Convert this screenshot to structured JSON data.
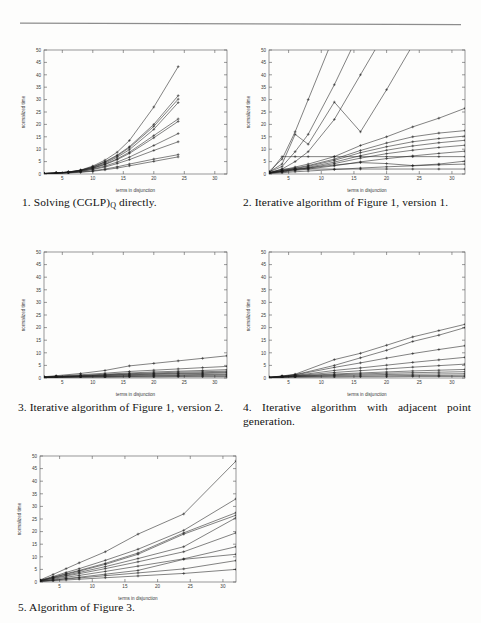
{
  "page": {
    "background": "#fdfdfc",
    "rule_color": "#8d8d8d"
  },
  "figures": [
    {
      "id": "fig1",
      "caption_number": "1.",
      "caption_text_before": "Solving (CGLP)",
      "caption_subscript": "Q",
      "caption_text_after": " directly.",
      "caption_plain": "1. Solving (CGLP)Q directly."
    },
    {
      "id": "fig2",
      "caption_number": "2.",
      "caption_plain": "2. Iterative algorithm of Figure 1, version 1."
    },
    {
      "id": "fig3",
      "caption_number": "3.",
      "caption_plain": "3. Iterative algorithm of Figure 1, version 2."
    },
    {
      "id": "fig4",
      "caption_number": "4.",
      "caption_plain": "4. Iterative algorithm with adjacent point generation."
    },
    {
      "id": "fig5",
      "caption_number": "5.",
      "caption_plain": "5. Algorithm of Figure 3."
    }
  ],
  "chart_data": [
    {
      "type": "line",
      "title": "1. Solving (CGLP)_Q directly.",
      "xlabel": "terms in disjunction",
      "ylabel": "normalized time",
      "xlim": [
        2,
        32
      ],
      "ylim": [
        0,
        50
      ],
      "xticks": [
        5,
        10,
        15,
        20,
        25,
        30
      ],
      "yticks": [
        0,
        5,
        10,
        15,
        20,
        25,
        30,
        35,
        40,
        45,
        50
      ],
      "grid": false,
      "legend": "none",
      "x": [
        2,
        4,
        6,
        8,
        10,
        12,
        14,
        16,
        20,
        24
      ],
      "series": [
        {
          "name": "s1",
          "values": [
            0.2,
            0.4,
            0.8,
            1.6,
            3.2,
            5.6,
            8.8,
            13.5,
            27.0,
            43.3
          ]
        },
        {
          "name": "s2",
          "values": [
            0.2,
            0.4,
            0.8,
            1.5,
            2.9,
            5.0,
            7.6,
            11.0,
            20.0,
            31.6
          ]
        },
        {
          "name": "s3",
          "values": [
            0.2,
            0.4,
            0.8,
            1.5,
            2.8,
            4.8,
            7.3,
            10.6,
            19.2,
            30.2
          ]
        },
        {
          "name": "s4",
          "values": [
            0.2,
            0.4,
            0.7,
            1.4,
            2.6,
            4.4,
            6.8,
            9.8,
            18.0,
            28.8
          ]
        },
        {
          "name": "s5",
          "values": [
            0.2,
            0.4,
            0.7,
            1.3,
            2.4,
            4.0,
            6.1,
            8.8,
            15.5,
            22.2
          ]
        },
        {
          "name": "s6",
          "values": [
            0.2,
            0.4,
            0.7,
            1.3,
            2.3,
            3.8,
            5.8,
            8.3,
            14.6,
            21.2
          ]
        },
        {
          "name": "s7",
          "values": [
            0.2,
            0.3,
            0.6,
            1.1,
            2.0,
            3.2,
            4.8,
            6.8,
            11.5,
            16.3
          ]
        },
        {
          "name": "s8",
          "values": [
            0.2,
            0.3,
            0.6,
            1.0,
            1.8,
            2.8,
            4.2,
            5.8,
            9.5,
            13.0
          ]
        },
        {
          "name": "s9",
          "values": [
            0.1,
            0.3,
            0.5,
            0.8,
            1.3,
            2.0,
            2.9,
            4.0,
            6.0,
            7.8
          ]
        },
        {
          "name": "s10",
          "values": [
            0.1,
            0.2,
            0.4,
            0.7,
            1.1,
            1.7,
            2.4,
            3.3,
            5.1,
            6.9
          ]
        }
      ]
    },
    {
      "type": "line",
      "title": "2. Iterative algorithm of Figure 1, version 1.",
      "xlabel": "terms in disjunction",
      "ylabel": "normalized time",
      "xlim": [
        2,
        32
      ],
      "ylim": [
        0,
        50
      ],
      "xticks": [
        5,
        10,
        15,
        20,
        25,
        30
      ],
      "yticks": [
        0,
        5,
        10,
        15,
        20,
        25,
        30,
        35,
        40,
        45,
        50
      ],
      "grid": false,
      "legend": "none",
      "x": [
        2,
        4,
        6,
        8,
        12,
        16,
        20,
        24,
        28,
        32
      ],
      "series": [
        {
          "name": "steep1",
          "values": [
            1.0,
            6.0,
            17.0,
            30.0,
            56.0,
            78.0,
            99.0,
            120.0,
            140.0,
            160.0
          ]
        },
        {
          "name": "steep2",
          "values": [
            0.8,
            3.0,
            9.0,
            16.0,
            36.0,
            58.0,
            80.0,
            100.0,
            120.0,
            140.0
          ]
        },
        {
          "name": "steep3",
          "values": [
            0.6,
            2.0,
            5.0,
            9.0,
            22.0,
            40.0,
            58.0,
            76.0,
            94.0,
            112.0
          ]
        },
        {
          "name": "zig",
          "values": [
            0.8,
            4.0,
            16.0,
            12.0,
            29.0,
            17.0,
            34.0,
            52.0,
            70.0,
            88.0
          ]
        },
        {
          "name": "lin1",
          "values": [
            0.6,
            1.6,
            2.8,
            4.0,
            7.0,
            11.5,
            15.0,
            19.0,
            22.5,
            26.5
          ]
        },
        {
          "name": "lin2",
          "values": [
            0.5,
            1.4,
            2.4,
            3.4,
            6.0,
            9.5,
            12.5,
            15.0,
            16.5,
            17.5
          ]
        },
        {
          "name": "lin3",
          "values": [
            0.5,
            1.3,
            2.2,
            3.1,
            5.5,
            8.6,
            11.0,
            13.0,
            14.3,
            15.3
          ]
        },
        {
          "name": "lin4",
          "values": [
            0.4,
            1.1,
            1.9,
            2.7,
            4.8,
            7.4,
            9.6,
            11.3,
            12.6,
            13.6
          ]
        },
        {
          "name": "lin5",
          "values": [
            0.4,
            1.0,
            1.7,
            2.4,
            4.2,
            6.4,
            8.2,
            9.6,
            10.7,
            11.6
          ]
        },
        {
          "name": "lin6",
          "values": [
            0.3,
            0.8,
            1.4,
            2.0,
            3.3,
            4.9,
            6.2,
            7.3,
            8.3,
            9.2
          ]
        },
        {
          "name": "flat7",
          "values": [
            0.3,
            7.0,
            7.0,
            7.0,
            7.0,
            7.0,
            7.0,
            7.0,
            7.0,
            7.0
          ]
        },
        {
          "name": "flat2",
          "values": [
            0.3,
            2.0,
            2.0,
            2.0,
            2.0,
            2.0,
            2.0,
            2.0,
            2.0,
            2.0
          ]
        },
        {
          "name": "bump",
          "values": [
            0.4,
            1.1,
            1.8,
            2.4,
            3.6,
            4.6,
            4.2,
            3.4,
            4.0,
            5.2
          ]
        },
        {
          "name": "low",
          "values": [
            0.2,
            0.5,
            0.9,
            1.2,
            1.8,
            2.4,
            2.9,
            3.3,
            3.7,
            4.0
          ]
        }
      ]
    },
    {
      "type": "line",
      "title": "3. Iterative algorithm of Figure 1, version 2.",
      "xlabel": "terms in disjunction",
      "ylabel": "normalized time",
      "xlim": [
        2,
        32
      ],
      "ylim": [
        0,
        50
      ],
      "xticks": [
        5,
        10,
        15,
        20,
        25,
        30
      ],
      "yticks": [
        0,
        5,
        10,
        15,
        20,
        25,
        30,
        35,
        40,
        45,
        50
      ],
      "grid": false,
      "legend": "none",
      "x": [
        2,
        4,
        8,
        12,
        16,
        20,
        24,
        28,
        32
      ],
      "series": [
        {
          "name": "t1",
          "values": [
            0.5,
            0.9,
            1.8,
            3.0,
            4.8,
            5.8,
            6.8,
            7.8,
            8.8
          ]
        },
        {
          "name": "t2",
          "values": [
            0.4,
            0.7,
            1.3,
            1.9,
            2.6,
            3.1,
            3.6,
            4.1,
            4.6
          ]
        },
        {
          "name": "t3",
          "values": [
            0.4,
            0.6,
            1.0,
            1.5,
            2.0,
            2.4,
            2.7,
            3.0,
            3.3
          ]
        },
        {
          "name": "t4",
          "values": [
            0.3,
            0.5,
            0.9,
            1.3,
            1.7,
            2.0,
            2.3,
            2.5,
            2.7
          ]
        },
        {
          "name": "t5",
          "values": [
            0.3,
            0.5,
            0.8,
            1.1,
            1.5,
            1.7,
            1.9,
            2.1,
            2.3
          ]
        },
        {
          "name": "t6",
          "values": [
            0.3,
            0.4,
            0.7,
            1.0,
            1.3,
            1.5,
            1.7,
            1.8,
            2.0
          ]
        },
        {
          "name": "t7",
          "values": [
            0.2,
            0.4,
            0.6,
            0.8,
            1.0,
            1.2,
            1.3,
            1.4,
            1.5
          ]
        },
        {
          "name": "t8",
          "values": [
            0.2,
            0.3,
            0.5,
            0.6,
            0.8,
            0.9,
            1.0,
            1.1,
            1.2
          ]
        },
        {
          "name": "t9",
          "values": [
            0.2,
            0.3,
            0.4,
            0.5,
            0.6,
            0.7,
            0.7,
            0.8,
            0.8
          ]
        },
        {
          "name": "t10",
          "values": [
            0.1,
            0.2,
            0.3,
            0.3,
            0.4,
            0.4,
            0.5,
            0.5,
            0.5
          ]
        }
      ]
    },
    {
      "type": "line",
      "title": "4. Iterative algorithm with adjacent point generation.",
      "xlabel": "terms in disjunction",
      "ylabel": "normalized time",
      "xlim": [
        2,
        32
      ],
      "ylim": [
        0,
        50
      ],
      "xticks": [
        5,
        10,
        15,
        20,
        25,
        30
      ],
      "yticks": [
        0,
        5,
        10,
        15,
        20,
        25,
        30,
        35,
        40,
        45,
        50
      ],
      "grid": false,
      "legend": "none",
      "x": [
        2,
        4,
        6,
        12,
        16,
        20,
        24,
        28,
        32
      ],
      "series": [
        {
          "name": "u1",
          "values": [
            0.3,
            0.8,
            1.5,
            7.3,
            9.8,
            13.0,
            16.3,
            18.8,
            21.3
          ]
        },
        {
          "name": "u2",
          "values": [
            0.3,
            0.7,
            1.3,
            5.0,
            8.0,
            11.0,
            14.5,
            17.0,
            20.0
          ]
        },
        {
          "name": "u3",
          "values": [
            0.3,
            0.7,
            1.2,
            4.2,
            6.0,
            7.9,
            9.7,
            11.3,
            12.8
          ]
        },
        {
          "name": "u4",
          "values": [
            0.3,
            0.6,
            1.0,
            3.0,
            4.0,
            5.1,
            6.2,
            7.2,
            8.2
          ]
        },
        {
          "name": "u5",
          "values": [
            0.2,
            0.5,
            0.9,
            2.2,
            2.9,
            3.6,
            4.3,
            4.9,
            5.5
          ]
        },
        {
          "name": "u6",
          "values": [
            0.2,
            0.5,
            0.8,
            1.6,
            2.0,
            2.4,
            2.8,
            3.1,
            3.4
          ]
        },
        {
          "name": "u7",
          "values": [
            0.2,
            0.4,
            0.7,
            1.3,
            1.6,
            1.9,
            2.1,
            2.3,
            2.5
          ]
        },
        {
          "name": "u8",
          "values": [
            0.2,
            0.4,
            0.6,
            1.0,
            1.2,
            1.4,
            1.5,
            1.6,
            1.7
          ]
        },
        {
          "name": "u9",
          "values": [
            0.1,
            0.3,
            0.5,
            0.7,
            0.8,
            0.9,
            1.0,
            1.0,
            1.1
          ]
        },
        {
          "name": "u10",
          "values": [
            0.1,
            0.2,
            0.3,
            0.4,
            0.5,
            0.5,
            0.6,
            0.6,
            0.6
          ]
        }
      ]
    },
    {
      "type": "line",
      "title": "5. Algorithm of Figure 3.",
      "xlabel": "terms in disjunction",
      "ylabel": "normalized time",
      "xlim": [
        2,
        32
      ],
      "ylim": [
        0,
        50
      ],
      "xticks": [
        5,
        10,
        15,
        20,
        25,
        30
      ],
      "yticks": [
        0,
        5,
        10,
        15,
        20,
        25,
        30,
        35,
        40,
        45,
        50
      ],
      "grid": false,
      "legend": "none",
      "x": [
        2,
        4,
        6,
        8,
        12,
        17,
        24,
        32
      ],
      "series": [
        {
          "name": "v1",
          "values": [
            0.8,
            3.0,
            5.3,
            7.6,
            12.0,
            19.0,
            27.0,
            48.0
          ]
        },
        {
          "name": "v2",
          "values": [
            0.7,
            2.2,
            3.8,
            5.3,
            8.6,
            13.0,
            20.5,
            33.0
          ]
        },
        {
          "name": "v3",
          "values": [
            0.6,
            1.9,
            3.3,
            4.6,
            7.4,
            11.5,
            19.5,
            27.5
          ]
        },
        {
          "name": "v4",
          "values": [
            0.6,
            1.8,
            3.1,
            4.3,
            7.0,
            11.0,
            19.0,
            26.5
          ]
        },
        {
          "name": "v5",
          "values": [
            0.5,
            1.6,
            2.7,
            3.8,
            6.1,
            9.3,
            14.0,
            25.5
          ]
        },
        {
          "name": "v6",
          "values": [
            0.5,
            1.4,
            2.4,
            3.3,
            5.3,
            8.0,
            12.0,
            19.5
          ]
        },
        {
          "name": "v7",
          "values": [
            0.4,
            1.1,
            1.9,
            2.6,
            4.2,
            6.3,
            9.2,
            14.0
          ]
        },
        {
          "name": "v8",
          "values": [
            0.3,
            0.8,
            1.4,
            1.9,
            3.1,
            4.6,
            9.0,
            11.0
          ]
        },
        {
          "name": "v9",
          "values": [
            0.3,
            0.7,
            1.2,
            1.6,
            2.5,
            3.6,
            5.2,
            8.5
          ]
        },
        {
          "name": "v10",
          "values": [
            0.2,
            0.5,
            0.8,
            1.1,
            1.7,
            2.4,
            3.4,
            5.0
          ]
        }
      ]
    }
  ]
}
